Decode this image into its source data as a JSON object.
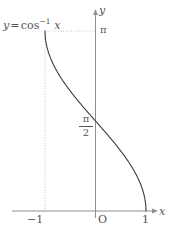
{
  "figure": {
    "background_color": "#ffffff",
    "curve_color": "#3b3b3b",
    "axis_color": "#8a8a8a",
    "guide_color": "#c0c0c0",
    "text_color": "#555555",
    "width": 170,
    "height": 236
  },
  "labels": {
    "equation_y": "y",
    "equation_equals": "=",
    "equation_fn": "cos",
    "equation_exp": "−1",
    "equation_arg": "x",
    "y_axis": "y",
    "x_axis": "x",
    "tick_pi": "π",
    "tick_pi_half_numerator": "π",
    "tick_pi_half_denominator": "2",
    "tick_origin": "O",
    "tick_neg_one": "−1",
    "tick_one": "1"
  },
  "chart_data": {
    "type": "line",
    "title": "",
    "subtitle": "",
    "xlabel": "x",
    "ylabel": "y",
    "function": "y = cos^-1(x)",
    "legend": [
      "y = cos⁻¹ x"
    ],
    "legend_position": "top-left-inline",
    "grid": false,
    "xlim": [
      -1,
      1
    ],
    "ylim": [
      0,
      3.14159
    ],
    "xticks": [
      -1,
      0,
      1
    ],
    "xtick_labels": [
      "−1",
      "O",
      "1"
    ],
    "yticks": [
      1.5708,
      3.14159
    ],
    "ytick_labels": [
      "π/2",
      "π"
    ],
    "annotations": [
      {
        "text": "y = cos⁻¹ x",
        "x": -1.0,
        "y": 3.14159,
        "placement": "above-left"
      },
      {
        "text": "dotted guide from (-1, π) horizontally to y-axis",
        "kind": "guide"
      },
      {
        "text": "dotted guide from (-1, π) vertically down to x-axis",
        "kind": "guide"
      }
    ],
    "series": [
      {
        "name": "y = cos⁻¹ x",
        "x": [
          -1.0,
          -0.99,
          -0.97,
          -0.94,
          -0.9,
          -0.85,
          -0.8,
          -0.7,
          -0.6,
          -0.5,
          -0.4,
          -0.3,
          -0.2,
          -0.1,
          0.0,
          0.1,
          0.2,
          0.3,
          0.4,
          0.5,
          0.6,
          0.7,
          0.8,
          0.85,
          0.9,
          0.94,
          0.97,
          0.99,
          1.0
        ],
        "y": [
          3.1416,
          2.9999,
          2.8952,
          2.7946,
          2.6906,
          2.597,
          2.4981,
          2.3462,
          2.2143,
          2.0944,
          1.9823,
          1.8755,
          1.7722,
          1.671,
          1.5708,
          1.4706,
          1.3694,
          1.2661,
          1.1593,
          1.0472,
          0.9273,
          0.7954,
          0.6435,
          0.5548,
          0.451,
          0.3478,
          0.2451,
          0.1415,
          0.0
        ]
      }
    ]
  }
}
